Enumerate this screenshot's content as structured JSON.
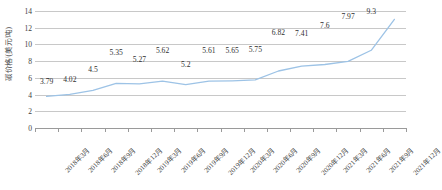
{
  "chart_data": {
    "type": "line",
    "title": "",
    "xlabel": "",
    "ylabel": "碳价格/(美元/吨)",
    "ylim": [
      0,
      14
    ],
    "yticks": [
      0,
      2,
      4,
      6,
      8,
      10,
      12,
      14
    ],
    "grid": true,
    "legend": "none",
    "series_color": "#9DC3E6",
    "categories": [
      "2018年3月",
      "2018年6月",
      "2018年9月",
      "2018年12月",
      "2019年3月",
      "2019年6月",
      "2019年9月",
      "2019年12月",
      "2020年3月",
      "2020年6月",
      "2020年9月",
      "2020年12月",
      "2021年3月",
      "2021年6月",
      "2021年9月",
      "2021年12月"
    ],
    "values": [
      3.79,
      4.02,
      4.5,
      5.35,
      5.27,
      5.62,
      5.2,
      5.61,
      5.65,
      5.75,
      6.82,
      7.41,
      7.6,
      7.97,
      9.3,
      13
    ],
    "data_labels": [
      "3.79",
      "4.02",
      "4.5",
      "5.35",
      "5.27",
      "5.62",
      "5.2",
      "5.61",
      "5.65",
      "5.75",
      "6.82",
      "7.41",
      "7.6",
      "7.97",
      "9.3",
      "13"
    ]
  }
}
